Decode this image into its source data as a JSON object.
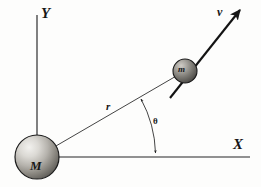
{
  "figure": {
    "background_color": "#fdfdfc",
    "ink_color": "#171717"
  },
  "axes": {
    "x_axis": {
      "label": "X",
      "origin": [
        37,
        157
      ],
      "end": [
        250,
        157
      ]
    },
    "y_axis": {
      "label": "Y",
      "origin": [
        37,
        157
      ],
      "end": [
        37,
        15
      ]
    }
  },
  "bodies": [
    {
      "name": "central-mass",
      "label": "M",
      "center": [
        37,
        157
      ],
      "radius": 22,
      "shading": "sphere-gradient-upper-left-light"
    },
    {
      "name": "orbiting-mass",
      "label": "m",
      "center": [
        185,
        71
      ],
      "radius": 12,
      "shading": "sphere-gradient-upper-left-light"
    }
  ],
  "vectors": {
    "radius": {
      "label": "r",
      "from": [
        37,
        157
      ],
      "to": [
        185,
        71
      ],
      "style": "thin-line"
    },
    "velocity": {
      "label": "v",
      "from": [
        172,
        96
      ],
      "to": [
        240,
        10
      ],
      "style": "thick-arrow"
    }
  },
  "angle": {
    "label": "θ",
    "vertex": [
      37,
      157
    ],
    "between": [
      "x-axis",
      "radius-line-r"
    ],
    "arc_arrow_style": "double-headed",
    "arc_arrow_upper_end": [
      140,
      97
    ],
    "arc_arrow_lower_end": [
      155,
      155
    ]
  },
  "construction_lines": {
    "center_cross_horizontal": {
      "from": [
        37,
        157
      ],
      "to": [
        59,
        157
      ],
      "style": "dashed"
    },
    "center_cross_vertical": {
      "from": [
        37,
        157
      ],
      "to": [
        37,
        137
      ],
      "style": "dashed"
    }
  }
}
